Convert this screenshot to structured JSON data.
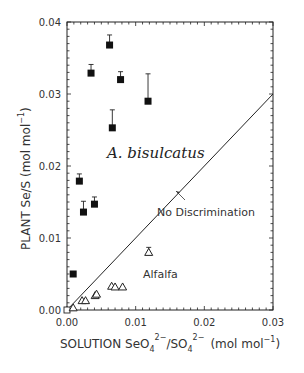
{
  "chart_data": {
    "type": "scatter",
    "title": "",
    "xlabel": "SOLUTION SeO4 2-/SO4 2- (mol mol-1)",
    "ylabel": "PLANT Se/S (mol mol-1)",
    "xlim": [
      0,
      0.03
    ],
    "ylim": [
      0,
      0.04
    ],
    "x_ticks": [
      "0.00",
      "0.01",
      "0.02",
      "0.03"
    ],
    "y_ticks": [
      "0.00",
      "0.01",
      "0.02",
      "0.03",
      "0.04"
    ],
    "grid": false,
    "series": [
      {
        "name": "A. bisulcatus",
        "marker": "filled-square",
        "points": [
          {
            "x": 0.0009,
            "y": 0.005,
            "err": 0
          },
          {
            "x": 0.0018,
            "y": 0.0179,
            "err": 0.001
          },
          {
            "x": 0.0024,
            "y": 0.0136,
            "err": 0.0015
          },
          {
            "x": 0.0035,
            "y": 0.0329,
            "err": 0.0012
          },
          {
            "x": 0.004,
            "y": 0.0147,
            "err": 0.001
          },
          {
            "x": 0.0062,
            "y": 0.0368,
            "err": 0.0014
          },
          {
            "x": 0.0066,
            "y": 0.0253,
            "err": 0.0025
          },
          {
            "x": 0.0078,
            "y": 0.032,
            "err": 0.0011
          },
          {
            "x": 0.0118,
            "y": 0.029,
            "err": 0.0038
          }
        ]
      },
      {
        "name": "Alfalfa",
        "marker": "open-triangle",
        "points": [
          {
            "x": 0.0,
            "y": 0.0,
            "err": 0
          },
          {
            "x": 0.0009,
            "y": 0.0003,
            "err": 0
          },
          {
            "x": 0.0022,
            "y": 0.0013,
            "err": 0
          },
          {
            "x": 0.0027,
            "y": 0.0013,
            "err": 0
          },
          {
            "x": 0.0041,
            "y": 0.002,
            "err": 0
          },
          {
            "x": 0.0043,
            "y": 0.0022,
            "err": 0
          },
          {
            "x": 0.0065,
            "y": 0.0033,
            "err": 0
          },
          {
            "x": 0.007,
            "y": 0.0032,
            "err": 0
          },
          {
            "x": 0.0081,
            "y": 0.0032,
            "err": 0
          },
          {
            "x": 0.0119,
            "y": 0.008,
            "err": 0.0007
          }
        ]
      },
      {
        "name": "No Discrimination",
        "type": "line",
        "x": [
          0,
          0.03
        ],
        "y": [
          0,
          0.03
        ]
      }
    ],
    "annotations": [
      {
        "text": "A. bisulcatus",
        "x": 0.004,
        "y": 0.0215
      },
      {
        "text": "No Discrimination",
        "x": 0.0128,
        "y": 0.0145
      },
      {
        "text": "Alfalfa",
        "x": 0.0108,
        "y": 0.006
      }
    ]
  },
  "labels": {
    "xlabel_main": "SOLUTION SeO",
    "xlabel_sub1": "4",
    "xlabel_sup1": "2−",
    "xlabel_mid": "/SO",
    "xlabel_sub2": "4",
    "xlabel_sup2": "2−",
    "xlabel_unit": "(mol mol",
    "xlabel_unit_sup": "−1",
    "xlabel_close": ")",
    "ylabel_main": "PLANT Se/S (mol mol",
    "ylabel_sup": "−1",
    "ylabel_close": ")",
    "ann_species": "A. bisulcatus",
    "ann_line": "No Discrimination",
    "ann_alfalfa": "Alfalfa"
  }
}
